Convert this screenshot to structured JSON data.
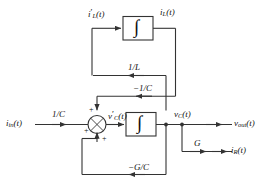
{
  "diagram": {
    "stroke_color": "#333333",
    "text_color": "#111111",
    "background": "#ffffff"
  },
  "signals": {
    "input": "i",
    "input_sub": "in",
    "input_suffix": "(t)",
    "inductor_deriv": "i",
    "inductor_deriv_sub": "L",
    "inductor_deriv_suffix": "(t)",
    "inductor_current": "i",
    "inductor_current_sub": "L",
    "inductor_current_suffix": "(t)",
    "cap_deriv": "v",
    "cap_deriv_sub": "C",
    "cap_deriv_suffix": "(t)",
    "cap_voltage": "v",
    "cap_voltage_sub": "C",
    "cap_voltage_suffix": "(t)",
    "output": "v",
    "output_sub": "out",
    "output_suffix": "(t)",
    "resistor_current": "i",
    "resistor_current_sub": "R",
    "resistor_current_suffix": "(t)"
  },
  "gains": {
    "input_gain": "1/C",
    "inductor_gain": "1/L",
    "cap_feedback_gain": "−1/C",
    "conductance_gain": "G",
    "conductance_feedback_gain": "−G/C"
  },
  "blocks": {
    "integrator_symbol": "∫",
    "integrator_top_name": "inductor integrator",
    "integrator_bottom_name": "capacitor integrator"
  },
  "summing_junction": {
    "sign_top": "+",
    "sign_left": "+",
    "sign_bottom": "+"
  }
}
